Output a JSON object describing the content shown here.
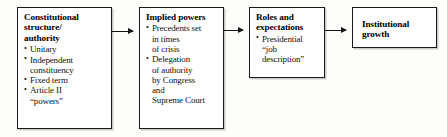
{
  "diagram": {
    "type": "flow-chart",
    "orientation": "left-to-right",
    "boxes": [
      {
        "id": "constitutional-structure",
        "heading": "Constitutional\nstructure/\nauthority",
        "bullets": [
          "Unitary",
          "Independent\n  constituency",
          "Fixed term",
          "Article II\n  “powers”"
        ]
      },
      {
        "id": "implied-powers",
        "heading": "Implied powers",
        "bullets": [
          "Precedents set\n  in times\n  of crisis",
          "Delegation\n  of authority\n  by Congress\n  and\n  Supreme Court"
        ]
      },
      {
        "id": "roles-and-expectations",
        "heading": "Roles and\nexpectations",
        "bullets": [
          "Presidential\n  “job\n  description”"
        ]
      },
      {
        "id": "institutional-growth",
        "heading": "Institutional\ngrowth",
        "bullets": []
      }
    ],
    "arrows": [
      {
        "id": "arrow-structure-to-implied",
        "from": "constitutional-structure",
        "to": "implied-powers",
        "glyph": "arrow-right-icon"
      },
      {
        "id": "arrow-implied-to-roles",
        "from": "implied-powers",
        "to": "roles-and-expectations",
        "glyph": "arrow-right-icon"
      },
      {
        "id": "arrow-roles-to-growth",
        "from": "roles-and-expectations",
        "to": "institutional-growth",
        "glyph": "arrow-right-icon"
      }
    ],
    "colors": {
      "background": "#fdfdfb",
      "box_fill": "#ffffff",
      "border": "#1a1a1a",
      "text": "#111111",
      "arrow": "#141414"
    }
  }
}
